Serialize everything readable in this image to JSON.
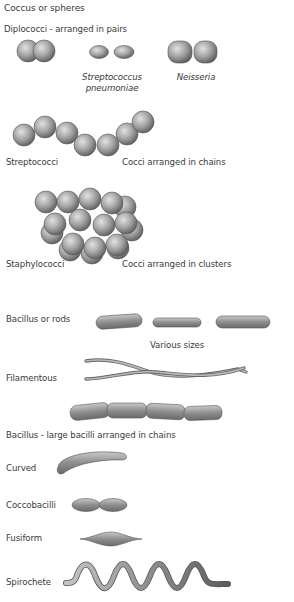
{
  "diagram": {
    "sections": {
      "coccus": {
        "title": "Coccus or spheres",
        "diplococci_label": "Diplococci - arranged in pairs",
        "strep_pneumo_line1": "Streptococcus",
        "strep_pneumo_line2": "pneumoniae",
        "neisseria": "Neisseria",
        "streptococci": "Streptococci",
        "chains_desc": "Cocci arranged in chains",
        "staphylococci": "Staphylococci",
        "clusters_desc": "Cocci arranged in clusters"
      },
      "bacillus": {
        "title": "Bacillus or rods",
        "various_sizes": "Various sizes",
        "filamentous": "Filamentous",
        "chains_label": "Bacillus - large bacilli arranged in chains"
      },
      "other": {
        "curved": "Curved",
        "coccobacilli": "Coccobacilli",
        "fusiform": "Fusiform",
        "spirochete": "Spirochete"
      }
    },
    "colors": {
      "cell_light": "#d6d6d6",
      "cell_mid": "#9a9a9a",
      "cell_dark": "#5e5e5e",
      "outline": "#555555",
      "text": "#3a3a3a"
    }
  }
}
